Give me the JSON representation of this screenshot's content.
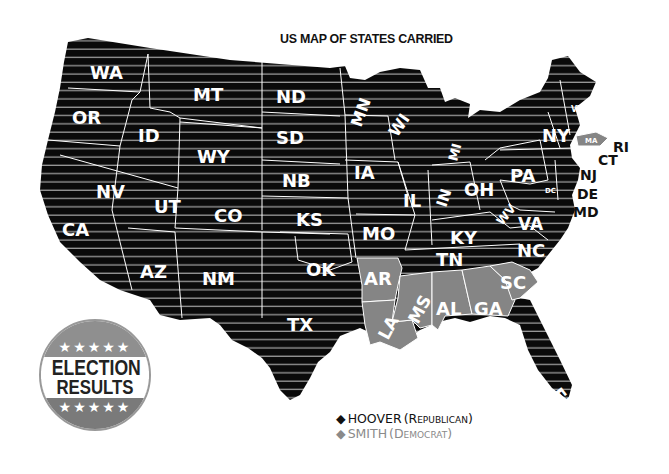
{
  "title": "US MAP OF STATES CARRIED",
  "badge": {
    "line1": "ELECTION",
    "line2": "RESULTS",
    "stars_top": "★★★★★",
    "stars_bottom": "★★★★★"
  },
  "legend": {
    "republican": {
      "marker": "◆",
      "name": "HOOVER",
      "party": "(Republican)",
      "color": "#111111"
    },
    "democrat": {
      "marker": "◆",
      "name": "SMITH",
      "party": "(Democrat)",
      "color": "#8a8a8a"
    }
  },
  "colors": {
    "republican_fill": "#0a0a0a",
    "democrat_fill": "#858585",
    "stripe": "#9a9a9a",
    "border": "#ffffff"
  },
  "states": {
    "WA": "WA",
    "OR": "OR",
    "CA": "CA",
    "ID": "ID",
    "NV": "NV",
    "MT": "MT",
    "WY": "WY",
    "UT": "UT",
    "AZ": "AZ",
    "CO": "CO",
    "NM": "NM",
    "ND": "ND",
    "SD": "SD",
    "NB": "NB",
    "KS": "KS",
    "OK": "OK",
    "TX": "TX",
    "MN": "MN",
    "IA": "IA",
    "MO": "MO",
    "AR": "AR",
    "LA": "LA",
    "WI": "WI",
    "IL": "IL",
    "MI": "MI",
    "IN": "IN",
    "OH": "OH",
    "KY": "KY",
    "TN": "TN",
    "MS": "MS",
    "AL": "AL",
    "GA": "GA",
    "FL": "FL",
    "SC": "SC",
    "NC": "NC",
    "VA": "VA",
    "WV": "WV",
    "PA": "PA",
    "NY": "NY",
    "VT": "VT",
    "NH": "NH",
    "ME": "ME",
    "MA": "MA",
    "RI": "RI",
    "CT": "CT",
    "NJ": "NJ",
    "DE": "DE",
    "MD": "MD",
    "DC": "DC"
  },
  "results": {
    "hoover": [
      "WA",
      "OR",
      "CA",
      "ID",
      "NV",
      "MT",
      "WY",
      "UT",
      "AZ",
      "CO",
      "NM",
      "ND",
      "SD",
      "NB",
      "KS",
      "OK",
      "TX",
      "MN",
      "IA",
      "MO",
      "WI",
      "IL",
      "MI",
      "IN",
      "OH",
      "KY",
      "TN",
      "FL",
      "NC",
      "VA",
      "WV",
      "PA",
      "NY",
      "VT",
      "NH",
      "ME",
      "CT",
      "NJ",
      "DE",
      "MD"
    ],
    "smith": [
      "AR",
      "LA",
      "MS",
      "AL",
      "GA",
      "SC",
      "MA",
      "RI"
    ]
  }
}
